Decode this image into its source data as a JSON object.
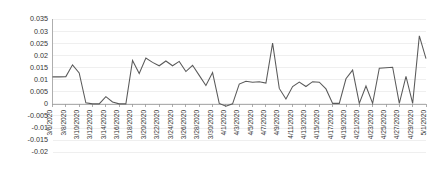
{
  "chart_data": {
    "type": "line",
    "title": "",
    "subtitle": "",
    "xlabel": "",
    "ylabel": "",
    "grid": true,
    "legend": null,
    "legend_position": "none",
    "line_color": "#5a5a5a",
    "ylim": [
      -0.02,
      0.035
    ],
    "ytick_labels": [
      "0.035",
      "0.03",
      "0.025",
      "0.02",
      "0.015",
      "0.01",
      "0.005",
      "0",
      "-0.005",
      "-0.01",
      "-0.015",
      "-0.02"
    ],
    "ytick_values": [
      0.035,
      0.03,
      0.025,
      0.02,
      0.015,
      0.01,
      0.005,
      0,
      -0.005,
      -0.01,
      -0.015,
      -0.02
    ],
    "xtick_labels": [
      "3/6/2020",
      "3/8/2020",
      "3/10/2020",
      "3/12/2020",
      "3/14/2020",
      "3/16/2020",
      "3/18/2020",
      "3/20/2020",
      "3/22/2020",
      "3/24/2020",
      "3/26/2020",
      "3/28/2020",
      "3/30/2020",
      "4/1/2020",
      "4/3/2020",
      "4/5/2020",
      "4/7/2020",
      "4/9/2020",
      "4/11/2020",
      "4/13/2020",
      "4/15/2020",
      "4/17/2020",
      "4/19/2020",
      "4/21/2020",
      "4/23/2020",
      "4/25/2020",
      "4/27/2020",
      "4/29/2020",
      "5/1/2020"
    ],
    "x": [
      "3/6/2020",
      "3/7/2020",
      "3/8/2020",
      "3/9/2020",
      "3/10/2020",
      "3/11/2020",
      "3/12/2020",
      "3/13/2020",
      "3/14/2020",
      "3/15/2020",
      "3/16/2020",
      "3/17/2020",
      "3/18/2020",
      "3/19/2020",
      "3/20/2020",
      "3/21/2020",
      "3/22/2020",
      "3/23/2020",
      "3/24/2020",
      "3/25/2020",
      "3/26/2020",
      "3/27/2020",
      "3/28/2020",
      "3/29/2020",
      "3/30/2020",
      "3/31/2020",
      "4/1/2020",
      "4/2/2020",
      "4/3/2020",
      "4/4/2020",
      "4/5/2020",
      "4/6/2020",
      "4/7/2020",
      "4/8/2020",
      "4/9/2020",
      "4/10/2020",
      "4/11/2020",
      "4/12/2020",
      "4/13/2020",
      "4/14/2020",
      "4/15/2020",
      "4/16/2020",
      "4/17/2020",
      "4/18/2020",
      "4/19/2020",
      "4/20/2020",
      "4/21/2020",
      "4/22/2020",
      "4/23/2020",
      "4/24/2020",
      "4/25/2020",
      "4/26/2020",
      "4/27/2020",
      "4/28/2020",
      "4/29/2020",
      "4/30/2020",
      "5/1/2020"
    ],
    "values": [
      0.0112,
      0.0112,
      0.0113,
      0.0162,
      0.0128,
      0.0004,
      0.0,
      0.0,
      0.003,
      0.0008,
      0.0,
      0.0,
      0.018,
      0.0126,
      0.019,
      0.0172,
      0.0158,
      0.0178,
      0.0158,
      0.0176,
      0.0134,
      0.016,
      0.0118,
      0.0076,
      0.013,
      0.0002,
      -0.001,
      0.0,
      0.0082,
      0.0094,
      0.009,
      0.0092,
      0.0086,
      0.0252,
      0.0064,
      0.002,
      0.0072,
      0.009,
      0.0072,
      0.0092,
      0.009,
      0.0062,
      0.0002,
      0.0002,
      0.0104,
      0.014,
      0.0002,
      0.0074,
      0.0002,
      0.0148,
      0.015,
      0.0152,
      0.0002,
      0.0114,
      0.0002,
      0.0282,
      0.0188
    ]
  }
}
